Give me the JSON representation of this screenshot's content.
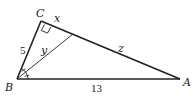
{
  "diagram": {
    "type": "right-triangle-with-angle-bisector",
    "vertices": {
      "A": {
        "label": "A",
        "x": 180,
        "y": 79
      },
      "B": {
        "label": "B",
        "x": 17,
        "y": 79
      },
      "C": {
        "label": "C",
        "x": 41,
        "y": 21
      }
    },
    "bisector_foot": {
      "x": 73,
      "y": 34
    },
    "labels": {
      "C": "C",
      "B": "B",
      "A": "A",
      "side_BC": "5",
      "side_BA": "13",
      "segment_CD": "x",
      "segment_DA": "z",
      "bisector": "y"
    },
    "right_angle_at": "C",
    "angle_bisector_from": "B",
    "colors": {
      "stroke": "#222222",
      "background": "#ffffff"
    }
  }
}
